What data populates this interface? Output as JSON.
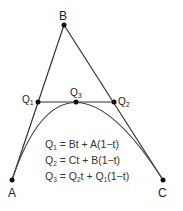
{
  "diagram": {
    "points": {
      "A": {
        "label": "A",
        "x": 12,
        "y": 180
      },
      "B": {
        "label": "B",
        "x": 64,
        "y": 25
      },
      "C": {
        "label": "C",
        "x": 163,
        "y": 180
      },
      "Q1": {
        "label": "Q",
        "sub": "1",
        "x": 38,
        "y": 102
      },
      "Q2": {
        "label": "Q",
        "sub": "2",
        "x": 114,
        "y": 102
      },
      "Q3": {
        "label": "Q",
        "sub": "3",
        "x": 76,
        "y": 102
      }
    },
    "equations": [
      {
        "lhs": "Q",
        "lhs_sub": "1",
        "rhs": "= Bt + A(1−t)"
      },
      {
        "lhs": "Q",
        "lhs_sub": "2",
        "rhs": "= Ct + B(1−t)"
      },
      {
        "lhs": "Q",
        "lhs_sub": "3",
        "rhs_a": "= Q",
        "rhs_a_sub": "2",
        "rhs_b": "t + Q",
        "rhs_b_sub": "1",
        "rhs_c": "(1−t)"
      }
    ],
    "colors": {
      "line": "#333333",
      "point": "#111111",
      "curve": "#444444"
    }
  }
}
